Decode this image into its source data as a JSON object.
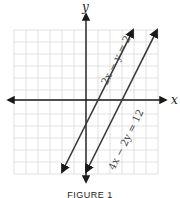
{
  "chart_data": {
    "type": "line",
    "title": "",
    "caption": "FIGURE 1",
    "xlabel": "x",
    "ylabel": "y",
    "xlim": [
      -6,
      6
    ],
    "ylim": [
      -6,
      6
    ],
    "grid": true,
    "grid_step": 1,
    "series": [
      {
        "name": "2x − y = 2",
        "label": "2x − y = 2",
        "slope": 2,
        "intercept": -2,
        "x": [
          -2,
          3.92
        ],
        "y": [
          -6,
          5.83
        ],
        "color": "#3a3a3a",
        "arrows": "both"
      },
      {
        "name": "4x − 2y = 12",
        "label": "4x − 2y = 12",
        "slope": 2,
        "intercept": -6,
        "x": [
          0,
          5.92
        ],
        "y": [
          -6,
          5.83
        ],
        "color": "#3a3a3a",
        "arrows": "both"
      }
    ]
  }
}
